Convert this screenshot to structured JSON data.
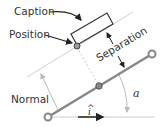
{
  "diagram": {
    "labels": {
      "caption": "Caption",
      "position": "Position",
      "separation": "Separation",
      "normal": "Normal",
      "angle": "a",
      "unit_vector": "i",
      "unit_vector_hat": "^"
    },
    "colors": {
      "line_dark": "#333333",
      "line_gray": "#999999",
      "line_light": "#cccccc",
      "node_fill": "#888888"
    }
  }
}
